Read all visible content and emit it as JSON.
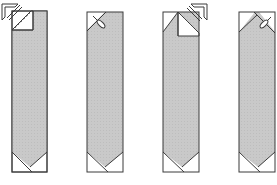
{
  "diagram": {
    "colors": {
      "fill": "#c8c8c8",
      "stroke": "#3a3a3a",
      "paper": "#ffffff",
      "fold_line": "#555555"
    },
    "steps": [
      {
        "index": 1,
        "description": "Fold top-left corner down diagonally (arrow indicates fold direction)",
        "icon": "fold-arrow-icon"
      },
      {
        "index": 2,
        "description": "Top corner folded; cut/crease mark shown",
        "icon": "scissors-icon"
      },
      {
        "index": 3,
        "description": "Fold top-right flap (arrow indicates fold direction)",
        "icon": "fold-arrow-icon"
      },
      {
        "index": 4,
        "description": "Top forms a point; crease mark shown",
        "icon": "scissors-icon"
      }
    ]
  }
}
